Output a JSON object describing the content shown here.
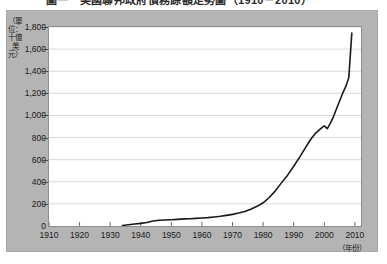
{
  "figure": {
    "title": "圖一　美國聯邦政府債務餘額走勢圖（1910－2010）",
    "y_axis_caption": "（單位：十億美元）",
    "x_axis_caption": "（年份）"
  },
  "chart_data": {
    "type": "line",
    "title": "圖一　美國聯邦政府債務餘額走勢圖（1910－2010）",
    "xlabel": "（年份）",
    "ylabel": "（單位：十億美元）",
    "xlim": [
      1910,
      2012
    ],
    "ylim": [
      0,
      1800
    ],
    "grid": true,
    "legend": "none",
    "y_ticks": [
      0,
      200,
      400,
      600,
      800,
      1000,
      1200,
      1400,
      1600,
      1800
    ],
    "y_tick_labels": [
      "0",
      "200",
      "400",
      "600",
      "800",
      "1,000",
      "1,200",
      "1,400",
      "1,600",
      "1,800"
    ],
    "x_ticks": [
      1910,
      1920,
      1930,
      1940,
      1950,
      1960,
      1970,
      1980,
      1990,
      2000,
      2010
    ],
    "x_tick_labels": [
      "1910",
      "1920",
      "1930",
      "1940",
      "1950",
      "1960",
      "1970",
      "1980",
      "1990",
      "2000",
      "2010"
    ],
    "line_color": "#1a1a1a",
    "series": [
      {
        "name": "債務餘額",
        "x": [
          1934,
          1936,
          1938,
          1940,
          1942,
          1944,
          1946,
          1948,
          1950,
          1952,
          1954,
          1956,
          1958,
          1960,
          1962,
          1964,
          1966,
          1968,
          1970,
          1972,
          1974,
          1976,
          1978,
          1980,
          1982,
          1984,
          1986,
          1988,
          1990,
          1992,
          1994,
          1995,
          1996,
          1997,
          1998,
          1999,
          2000,
          2001,
          2002,
          2003,
          2004,
          2005,
          2006,
          2007,
          2008,
          2009
        ],
        "values": [
          5,
          12,
          18,
          24,
          32,
          45,
          52,
          54,
          57,
          60,
          64,
          66,
          69,
          72,
          76,
          82,
          88,
          96,
          105,
          118,
          132,
          152,
          178,
          210,
          258,
          318,
          390,
          460,
          540,
          625,
          715,
          760,
          800,
          835,
          860,
          885,
          905,
          880,
          930,
          990,
          1060,
          1130,
          1200,
          1260,
          1340,
          1745
        ]
      }
    ],
    "annotations": [
      {
        "label": "2000-2001 回落",
        "x": 2001,
        "y": 880
      },
      {
        "label": "2008-2009 急升",
        "x": 2009,
        "y": 1745
      }
    ]
  }
}
